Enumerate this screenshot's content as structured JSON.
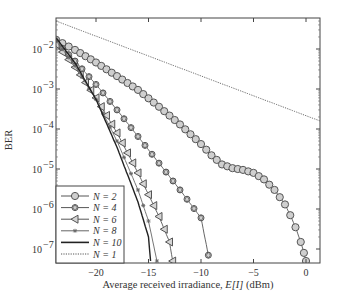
{
  "chart_data": {
    "type": "line",
    "title": "",
    "xlabel": "Average received irradiance, E[I] (dBm)",
    "ylabel": "BER",
    "yscale": "log",
    "xlim": [
      -24,
      1.3
    ],
    "ylim": [
      5e-08,
      0.06
    ],
    "grid": false,
    "legend_position": "lower left",
    "x_ticks": [
      -20,
      -15,
      -10,
      -5,
      0
    ],
    "x_tick_labels": [
      "−20",
      "−15",
      "−10",
      "−5",
      "0"
    ],
    "y_ticks": [
      0.01,
      0.001,
      0.0001,
      1e-05,
      1e-06,
      1e-07
    ],
    "y_tick_labels": [
      {
        "base": "10",
        "exp": "−2"
      },
      {
        "base": "10",
        "exp": "−3"
      },
      {
        "base": "10",
        "exp": "−4"
      },
      {
        "base": "10",
        "exp": "−5"
      },
      {
        "base": "10",
        "exp": "−6"
      },
      {
        "base": "10",
        "exp": "−7"
      }
    ],
    "series": [
      {
        "name": "N = 2",
        "marker": "circle",
        "style": "solid",
        "color": "#555555",
        "x": [
          -23.8,
          -22,
          -20,
          -18,
          -16,
          -14,
          -12,
          -10,
          -9,
          -8,
          -7,
          -6,
          -5,
          -4,
          -3,
          -2,
          -1.5,
          -1,
          -0.5,
          -0.2,
          0.0
        ],
        "y": [
          0.017,
          0.0095,
          0.0046,
          0.0021,
          0.00095,
          0.00036,
          0.00013,
          4.2e-05,
          2.2e-05,
          1.3e-05,
          1.05e-05,
          9.5e-06,
          8e-06,
          5.5e-06,
          3e-06,
          1.3e-06,
          7e-07,
          3.5e-07,
          1.5e-07,
          8e-08,
          5e-08
        ]
      },
      {
        "name": "N = 4",
        "marker": "diamond-circle",
        "style": "solid",
        "color": "#555555",
        "x": [
          -23.8,
          -22,
          -20,
          -18,
          -16,
          -14,
          -12,
          -10,
          -9.3
        ],
        "y": [
          0.015,
          0.005,
          0.0013,
          0.0003,
          6.5e-05,
          1.4e-05,
          3e-06,
          6e-07,
          7e-08
        ]
      },
      {
        "name": "N = 6",
        "marker": "triangle-left",
        "style": "solid",
        "color": "#555555",
        "x": [
          -23.8,
          -22,
          -20,
          -18,
          -16,
          -14,
          -13,
          -12.7
        ],
        "y": [
          0.013,
          0.0035,
          0.0006,
          8e-05,
          8e-06,
          6.5e-07,
          1.5e-07,
          5e-08
        ]
      },
      {
        "name": "N = 8",
        "marker": "asterisk",
        "style": "solid",
        "color": "#666666",
        "x": [
          -23.8,
          -22,
          -20,
          -18,
          -16,
          -15,
          -14.2
        ],
        "y": [
          0.016,
          0.0038,
          0.00055,
          5e-05,
          3e-06,
          5e-07,
          5e-08
        ]
      },
      {
        "name": "N = 10",
        "marker": "none",
        "style": "solid",
        "color": "#222222",
        "x": [
          -23.8,
          -22,
          -20,
          -18,
          -16,
          -15,
          -14.8
        ],
        "y": [
          0.019,
          0.0045,
          0.00055,
          3.5e-05,
          1.5e-06,
          2e-07,
          5e-08
        ]
      },
      {
        "name": "N = 1",
        "marker": "none",
        "style": "dotted",
        "color": "#555555",
        "x": [
          -23.8,
          1.3
        ],
        "y": [
          0.05,
          0.00016
        ]
      }
    ]
  },
  "legend": {
    "entries": [
      {
        "label": "N = 2"
      },
      {
        "label": "N = 4"
      },
      {
        "label": "N = 6"
      },
      {
        "label": "N = 8"
      },
      {
        "label": "N = 10"
      },
      {
        "label": "N = 1"
      }
    ]
  }
}
